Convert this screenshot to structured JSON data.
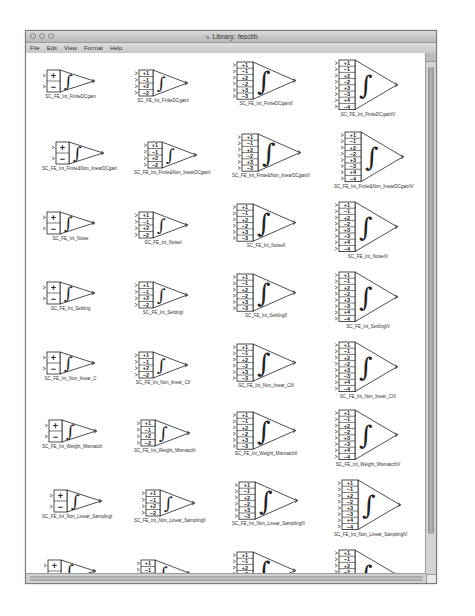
{
  "window": {
    "title": "Library: fesclib",
    "title_icon": "simulink-icon",
    "traffic_lights": [
      "close",
      "minimize",
      "zoom"
    ]
  },
  "menubar": {
    "items": [
      {
        "label": "File"
      },
      {
        "label": "Edit"
      },
      {
        "label": "View"
      },
      {
        "label": "Format"
      },
      {
        "label": "Help"
      }
    ]
  },
  "library": {
    "columns": [
      {
        "inputs": [
          "+",
          "−"
        ]
      },
      {
        "inputs": [
          "+1",
          "−1",
          "+2",
          "−2"
        ]
      },
      {
        "inputs": [
          "+1",
          "−1",
          "+2",
          "−2",
          "+3",
          "−3"
        ]
      },
      {
        "inputs": [
          "+1",
          "−1",
          "+2",
          "−2",
          "+3",
          "−3",
          "+4",
          "−4"
        ]
      }
    ],
    "rows": [
      {
        "blocks": [
          {
            "label": "SC_FE_Int_FiniteDCgain"
          },
          {
            "label": "SC_FE_Int_FiniteDCgainI"
          },
          {
            "label": "SC_FE_Int_FiniteDCgainII"
          },
          {
            "label": "SC_FE_Int_FiniteDCgainIV"
          }
        ]
      },
      {
        "blocks": [
          {
            "label": "SC_FE_Int_Finite&Non_linearDCgain"
          },
          {
            "label": "SC_FE_Int_Finite&Non_linearDCgainI"
          },
          {
            "label": "SC_FE_Int_Finite&Non_linearDCgainII"
          },
          {
            "label": "SC_FE_Int_Finite&Non_linearDCgainIV"
          }
        ]
      },
      {
        "blocks": [
          {
            "label": "SC_FE_Int_Noise"
          },
          {
            "label": "SC_FE_Int_NoiseI"
          },
          {
            "label": "SC_FE_Int_NoiseII"
          },
          {
            "label": "SC_FE_Int_NoiseIV"
          }
        ]
      },
      {
        "blocks": [
          {
            "label": "SC_FE_Int_Settling"
          },
          {
            "label": "SC_FE_Int_SettlingI"
          },
          {
            "label": "SC_FE_Int_SettlingII"
          },
          {
            "label": "SC_FE_Int_SettlingIV"
          }
        ]
      },
      {
        "blocks": [
          {
            "label": "SC_FE_Int_Non_linear_C"
          },
          {
            "label": "SC_FE_Int_Non_linear_CII"
          },
          {
            "label": "SC_FE_Int_Non_linear_CIII"
          },
          {
            "label": "SC_FE_Int_Non_linear_CIV"
          }
        ]
      },
      {
        "blocks": [
          {
            "label": "SC_FE_Int_Weight_Mismatch"
          },
          {
            "label": "SC_FE_Int_Weight_MismatchI"
          },
          {
            "label": "SC_FE_Int_Weight_MismatchII"
          },
          {
            "label": "SC_FE_Int_Weight_MismatchIV"
          }
        ]
      },
      {
        "blocks": [
          {
            "label": "SC_FE_Int_Non_Linear_SamplingI"
          },
          {
            "label": "SC_FE_Int_Non_Linear_SamplingII"
          },
          {
            "label": "SC_FE_Int_Non_Linear_SamplingIII"
          },
          {
            "label": "SC_FE_Int_Non_Linear_SamplingIV"
          }
        ]
      },
      {
        "blocks": [
          {
            "label": "SC_FE_Integrator_All_Effects"
          },
          {
            "label": "SC_FE_Integrator_All_EffectsI"
          },
          {
            "label": "SC_FE_Integrator_All_EffectsII"
          },
          {
            "label": "SC_FE_Integrator_All_EffectsIV"
          }
        ]
      }
    ]
  },
  "scrollbars": {
    "vertical": "scrollbar",
    "horizontal": "scrollbar"
  }
}
